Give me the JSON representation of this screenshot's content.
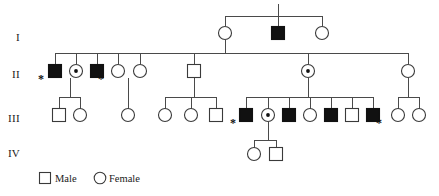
{
  "figure": {
    "type": "pedigree-chart",
    "title": "",
    "colors": {
      "affected_fill": "#111111",
      "unaffected_fill": "#ffffff",
      "line": "#4a4a4a",
      "stroke": "#3a3a3a",
      "text": "#1a1a1a"
    }
  },
  "generation_labels": [
    {
      "id": "gen-label-1",
      "text": "I",
      "x": 18,
      "y": 41
    },
    {
      "id": "gen-label-2",
      "text": "II",
      "x": 16,
      "y": 78
    },
    {
      "id": "gen-label-3",
      "text": "III",
      "x": 14,
      "y": 122
    },
    {
      "id": "gen-label-4",
      "text": "IV",
      "x": 14,
      "y": 157
    }
  ],
  "legend": {
    "male": {
      "label": "Male",
      "shape": "square",
      "filled": false,
      "x": 45,
      "y": 182
    },
    "female": {
      "label": "Female",
      "shape": "circle",
      "filled": false,
      "x": 100,
      "y": 182
    }
  },
  "symbols": {
    "size": 13,
    "radius": 6.5
  },
  "individuals": [
    {
      "id": "I-1",
      "generation": "I",
      "sex": "female",
      "shape": "circle",
      "status": "unaffected",
      "carrier": false,
      "starred": false,
      "x": 225,
      "y": 33
    },
    {
      "id": "I-2",
      "generation": "I",
      "sex": "male",
      "shape": "square",
      "status": "affected",
      "carrier": false,
      "starred": false,
      "x": 278,
      "y": 33
    },
    {
      "id": "I-3",
      "generation": "I",
      "sex": "female",
      "shape": "circle",
      "status": "unaffected",
      "carrier": false,
      "starred": false,
      "x": 322,
      "y": 33
    },
    {
      "id": "II-1",
      "generation": "II",
      "sex": "male",
      "shape": "square",
      "status": "affected",
      "carrier": false,
      "starred": true,
      "x": 55,
      "y": 71
    },
    {
      "id": "II-2",
      "generation": "II",
      "sex": "female",
      "shape": "circle",
      "status": "unaffected",
      "carrier": true,
      "starred": false,
      "x": 76,
      "y": 71
    },
    {
      "id": "II-3",
      "generation": "II",
      "sex": "male",
      "shape": "square",
      "status": "affected",
      "carrier": false,
      "starred": true,
      "x": 97,
      "y": 71
    },
    {
      "id": "II-4",
      "generation": "II",
      "sex": "female",
      "shape": "circle",
      "status": "unaffected",
      "carrier": false,
      "starred": false,
      "x": 118,
      "y": 71
    },
    {
      "id": "II-5",
      "generation": "II",
      "sex": "female",
      "shape": "circle",
      "status": "unaffected",
      "carrier": false,
      "starred": false,
      "x": 140,
      "y": 71
    },
    {
      "id": "II-6",
      "generation": "II",
      "sex": "male",
      "shape": "square",
      "status": "unaffected",
      "carrier": false,
      "starred": false,
      "x": 194,
      "y": 71
    },
    {
      "id": "II-7",
      "generation": "II",
      "sex": "female",
      "shape": "circle",
      "status": "unaffected",
      "carrier": true,
      "starred": false,
      "x": 308,
      "y": 71
    },
    {
      "id": "II-8",
      "generation": "II",
      "sex": "female",
      "shape": "circle",
      "status": "unaffected",
      "carrier": false,
      "starred": false,
      "x": 408,
      "y": 71
    },
    {
      "id": "III-1",
      "generation": "III",
      "sex": "male",
      "shape": "square",
      "status": "unaffected",
      "carrier": false,
      "starred": false,
      "x": 59,
      "y": 115
    },
    {
      "id": "III-2",
      "generation": "III",
      "sex": "female",
      "shape": "circle",
      "status": "unaffected",
      "carrier": false,
      "starred": false,
      "x": 80,
      "y": 115
    },
    {
      "id": "III-3",
      "generation": "III",
      "sex": "female",
      "shape": "circle",
      "status": "unaffected",
      "carrier": false,
      "starred": false,
      "x": 128,
      "y": 115
    },
    {
      "id": "III-4",
      "generation": "III",
      "sex": "female",
      "shape": "circle",
      "status": "unaffected",
      "carrier": false,
      "starred": false,
      "x": 165,
      "y": 115
    },
    {
      "id": "III-5",
      "generation": "III",
      "sex": "female",
      "shape": "circle",
      "status": "unaffected",
      "carrier": false,
      "starred": false,
      "x": 191,
      "y": 115
    },
    {
      "id": "III-6",
      "generation": "III",
      "sex": "male",
      "shape": "square",
      "status": "unaffected",
      "carrier": false,
      "starred": false,
      "x": 216,
      "y": 115
    },
    {
      "id": "III-7",
      "generation": "III",
      "sex": "male",
      "shape": "square",
      "status": "affected",
      "carrier": false,
      "starred": true,
      "x": 246,
      "y": 115
    },
    {
      "id": "III-8",
      "generation": "III",
      "sex": "female",
      "shape": "circle",
      "status": "unaffected",
      "carrier": true,
      "starred": false,
      "x": 268,
      "y": 115
    },
    {
      "id": "III-9",
      "generation": "III",
      "sex": "male",
      "shape": "square",
      "status": "affected",
      "carrier": false,
      "starred": false,
      "x": 289,
      "y": 115
    },
    {
      "id": "III-10",
      "generation": "III",
      "sex": "female",
      "shape": "circle",
      "status": "unaffected",
      "carrier": false,
      "starred": false,
      "x": 310,
      "y": 115
    },
    {
      "id": "III-11",
      "generation": "III",
      "sex": "male",
      "shape": "square",
      "status": "affected",
      "carrier": false,
      "starred": false,
      "x": 331,
      "y": 115
    },
    {
      "id": "III-12",
      "generation": "III",
      "sex": "male",
      "shape": "square",
      "status": "unaffected",
      "carrier": false,
      "starred": false,
      "x": 352,
      "y": 115
    },
    {
      "id": "III-13",
      "generation": "III",
      "sex": "male",
      "shape": "square",
      "status": "affected",
      "carrier": false,
      "starred": true,
      "x": 373,
      "y": 115
    },
    {
      "id": "III-14",
      "generation": "III",
      "sex": "female",
      "shape": "circle",
      "status": "unaffected",
      "carrier": false,
      "starred": false,
      "x": 398,
      "y": 115
    },
    {
      "id": "III-15",
      "generation": "III",
      "sex": "female",
      "shape": "circle",
      "status": "unaffected",
      "carrier": false,
      "starred": false,
      "x": 419,
      "y": 115
    },
    {
      "id": "IV-1",
      "generation": "IV",
      "sex": "female",
      "shape": "circle",
      "status": "unaffected",
      "carrier": false,
      "starred": false,
      "x": 254,
      "y": 154
    },
    {
      "id": "IV-2",
      "generation": "IV",
      "sex": "male",
      "shape": "square",
      "status": "unaffected",
      "carrier": false,
      "starred": false,
      "x": 276,
      "y": 154
    }
  ],
  "connectors": [
    {
      "id": "c-top-stub",
      "type": "line",
      "points": "278,4 278,16"
    },
    {
      "id": "c-gen1-sib",
      "type": "line",
      "points": "225,16 322,16"
    },
    {
      "id": "c-gen1-d1",
      "type": "line",
      "points": "225,16 225,26"
    },
    {
      "id": "c-gen1-d2",
      "type": "line",
      "points": "278,16 278,26"
    },
    {
      "id": "c-gen1-d3",
      "type": "line",
      "points": "322,16 322,26"
    },
    {
      "id": "c-gen1-desc",
      "type": "line",
      "points": "225,40 225,53"
    },
    {
      "id": "c-gen2-sib",
      "type": "line",
      "points": "55,53 408,53"
    },
    {
      "id": "c-gen2-d1",
      "type": "line",
      "points": "55,53 55,64"
    },
    {
      "id": "c-gen2-d2",
      "type": "line",
      "points": "76,53 76,64"
    },
    {
      "id": "c-gen2-d3",
      "type": "line",
      "points": "97,53 97,64"
    },
    {
      "id": "c-gen2-d4",
      "type": "line",
      "points": "118,53 118,64"
    },
    {
      "id": "c-gen2-d5",
      "type": "line",
      "points": "140,53 140,64"
    },
    {
      "id": "c-gen2-d6",
      "type": "line",
      "points": "194,53 194,64"
    },
    {
      "id": "c-gen2-d7",
      "type": "line",
      "points": "308,53 308,64"
    },
    {
      "id": "c-gen2-d8",
      "type": "line",
      "points": "408,53 408,64"
    },
    {
      "id": "c-f1-desc",
      "type": "line",
      "points": "70,78 70,97"
    },
    {
      "id": "c-f1-sib",
      "type": "line",
      "points": "59,97 80,97"
    },
    {
      "id": "c-f1-d1",
      "type": "line",
      "points": "59,97 59,109"
    },
    {
      "id": "c-f1-d2",
      "type": "line",
      "points": "80,97 80,109"
    },
    {
      "id": "c-f2-desc",
      "type": "line",
      "points": "128,78 128,109"
    },
    {
      "id": "c-f3-desc",
      "type": "line",
      "points": "194,78 194,97"
    },
    {
      "id": "c-f3-sib",
      "type": "line",
      "points": "165,97 216,97"
    },
    {
      "id": "c-f3-d1",
      "type": "line",
      "points": "165,97 165,109"
    },
    {
      "id": "c-f3-d2",
      "type": "line",
      "points": "191,97 191,109"
    },
    {
      "id": "c-f3-d3",
      "type": "line",
      "points": "216,97 216,109"
    },
    {
      "id": "c-f4-desc",
      "type": "line",
      "points": "308,78 308,97"
    },
    {
      "id": "c-f4-sib",
      "type": "line",
      "points": "246,97 373,97"
    },
    {
      "id": "c-f4-d1",
      "type": "line",
      "points": "246,97 246,109"
    },
    {
      "id": "c-f4-d2",
      "type": "line",
      "points": "268,97 268,109"
    },
    {
      "id": "c-f4-d3",
      "type": "line",
      "points": "289,97 289,109"
    },
    {
      "id": "c-f4-d4",
      "type": "line",
      "points": "310,97 310,109"
    },
    {
      "id": "c-f4-d5",
      "type": "line",
      "points": "331,97 331,109"
    },
    {
      "id": "c-f4-d6",
      "type": "line",
      "points": "352,97 352,109"
    },
    {
      "id": "c-f4-d7",
      "type": "line",
      "points": "373,97 373,109"
    },
    {
      "id": "c-f5-desc",
      "type": "line",
      "points": "408,78 408,97"
    },
    {
      "id": "c-f5-sib",
      "type": "line",
      "points": "398,97 419,97"
    },
    {
      "id": "c-f5-d1",
      "type": "line",
      "points": "398,97 398,109"
    },
    {
      "id": "c-f5-d2",
      "type": "line",
      "points": "419,97 419,109"
    },
    {
      "id": "c-f6-desc",
      "type": "line",
      "points": "268,122 268,140"
    },
    {
      "id": "c-f6-sib",
      "type": "line",
      "points": "254,140 276,140"
    },
    {
      "id": "c-f6-d1",
      "type": "line",
      "points": "254,140 254,148"
    },
    {
      "id": "c-f6-d2",
      "type": "line",
      "points": "276,140 276,148"
    }
  ],
  "asterisks": [
    {
      "id": "ast-II-1",
      "for": "II-1",
      "x": 41,
      "y": 83
    },
    {
      "id": "ast-II-3",
      "for": "II-3",
      "x": 101,
      "y": 83
    },
    {
      "id": "ast-III-7",
      "for": "III-7",
      "x": 233,
      "y": 127
    },
    {
      "id": "ast-III-13",
      "for": "III-13",
      "x": 379,
      "y": 127
    }
  ]
}
